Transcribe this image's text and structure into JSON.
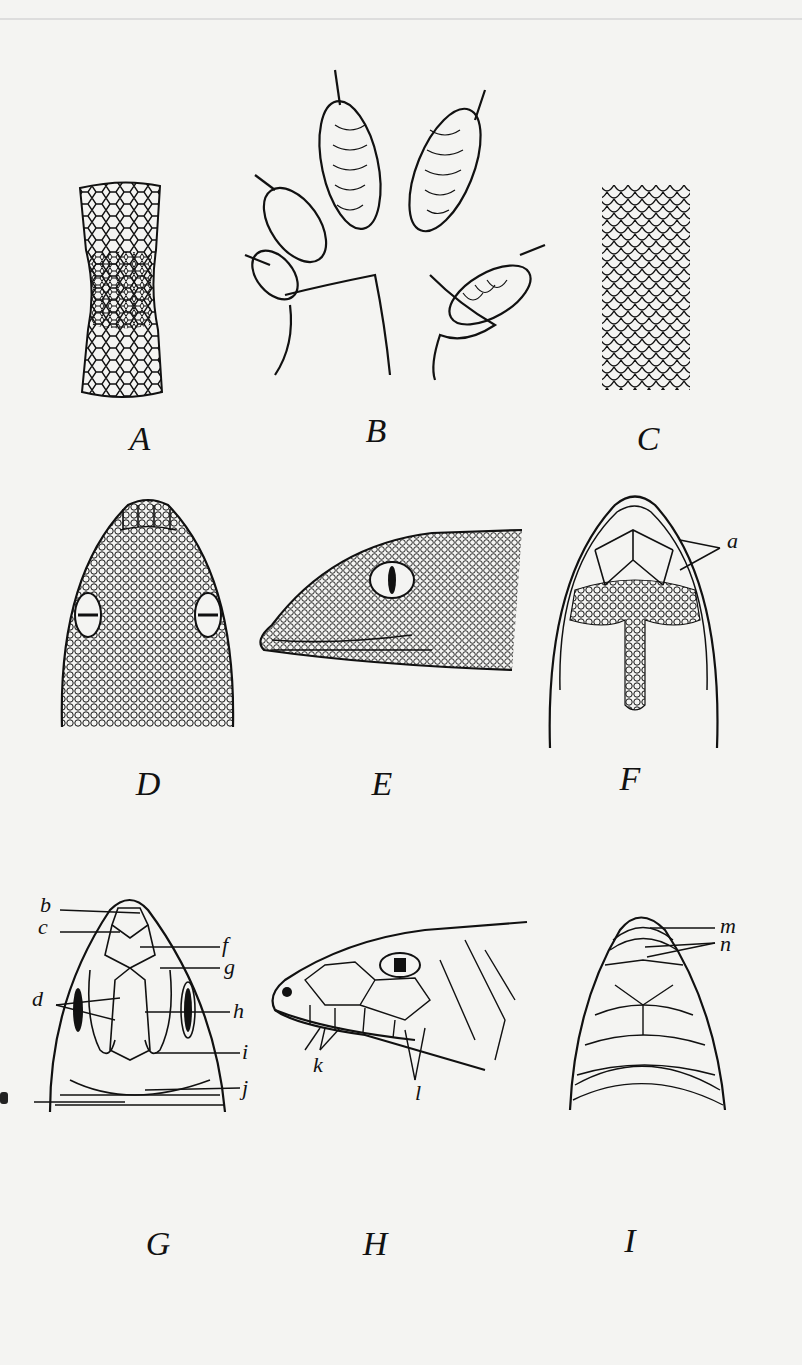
{
  "plate": {
    "figures": [
      {
        "id": "A",
        "caption": "A",
        "subject": "scale pattern patch (granular/hexagonal)"
      },
      {
        "id": "B",
        "caption": "B",
        "subject": "foot with lamellar toe pads"
      },
      {
        "id": "C",
        "caption": "C",
        "subject": "imbricate overlapping scales"
      },
      {
        "id": "D",
        "caption": "D",
        "subject": "dorsal view of head, granular scales"
      },
      {
        "id": "E",
        "caption": "E",
        "subject": "lateral view of head, granular scales, vertical pupil"
      },
      {
        "id": "F",
        "caption": "F",
        "subject": "ventral view of head",
        "labels": [
          "a"
        ]
      },
      {
        "id": "G",
        "caption": "G",
        "subject": "dorsal view of head with plates",
        "labels": [
          "b",
          "c",
          "d",
          "f",
          "g",
          "h",
          "i",
          "j"
        ]
      },
      {
        "id": "H",
        "caption": "H",
        "subject": "lateral view of head with plates",
        "labels": [
          "k",
          "l"
        ]
      },
      {
        "id": "I",
        "caption": "I",
        "subject": "ventral view of head with plates",
        "labels": [
          "m",
          "n"
        ]
      }
    ]
  },
  "colors": {
    "ink": "#111111",
    "paper": "#f4f4f2"
  }
}
